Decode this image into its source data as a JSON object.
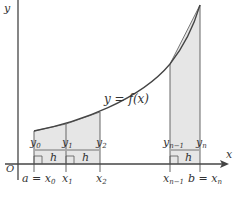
{
  "diagram": {
    "type": "trapezoidal-rule-illustration",
    "function_label": "y = f(x)",
    "axis_labels": {
      "x": "x",
      "y": "y",
      "origin": "O"
    },
    "x_ticks": [
      {
        "id": "x0",
        "label": "a = x",
        "sub": "0"
      },
      {
        "id": "x1",
        "label": "x",
        "sub": "1"
      },
      {
        "id": "x2",
        "label": "x",
        "sub": "2"
      },
      {
        "id": "xn1",
        "label": "x",
        "sub": "n − 1"
      },
      {
        "id": "xn",
        "label": "b = x",
        "sub": "n"
      }
    ],
    "ordinates": [
      {
        "label": "y",
        "sub": "0"
      },
      {
        "label": "y",
        "sub": "1"
      },
      {
        "label": "y",
        "sub": "2"
      },
      {
        "label": "y",
        "sub": "n − 1"
      },
      {
        "label": "y",
        "sub": "n"
      }
    ],
    "width_label": "h",
    "colors": {
      "fill": "#e6e6e6",
      "line": "#555555",
      "curve": "#444444"
    }
  }
}
